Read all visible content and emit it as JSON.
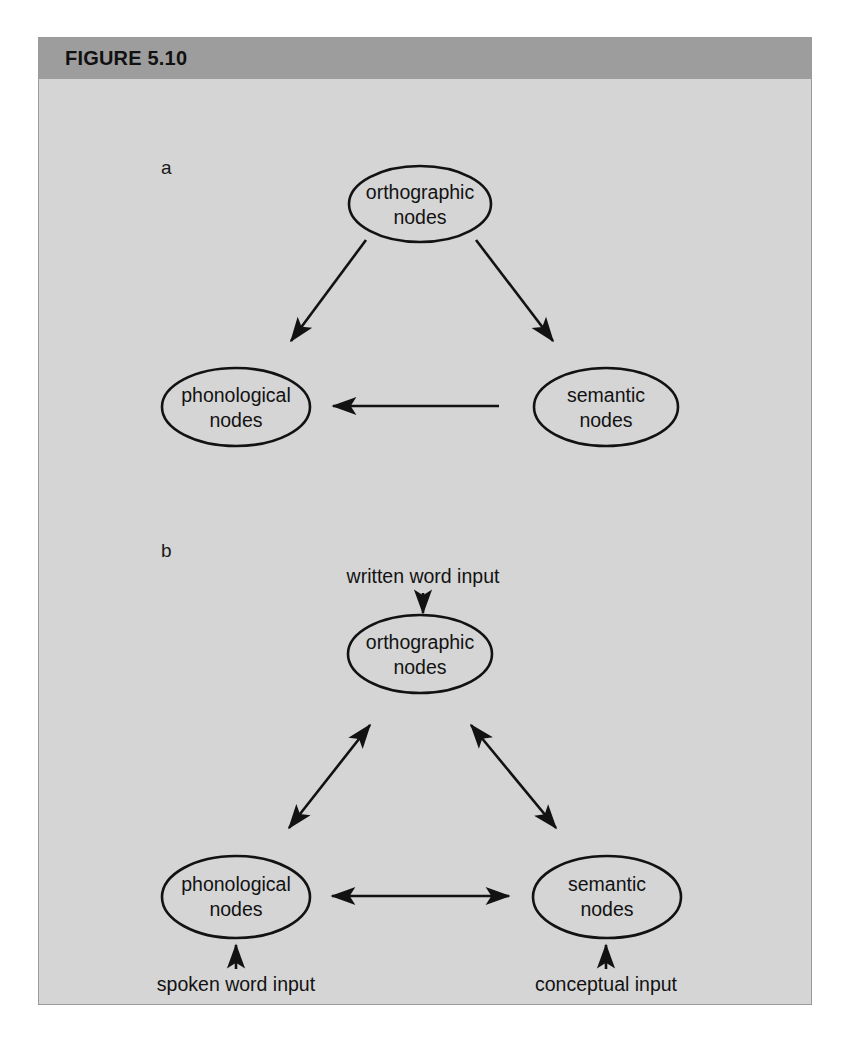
{
  "figure": {
    "header_label": "FIGURE 5.10",
    "background_color": "#d5d5d5",
    "header_color": "#9d9d9d",
    "border_color": "#9a9a9a",
    "ink_color": "#121212"
  },
  "panels": [
    {
      "letter": "a",
      "nodes": [
        {
          "id": "a-orthographic",
          "line1": "orthographic",
          "line2": "nodes"
        },
        {
          "id": "a-phonological",
          "line1": "phonological",
          "line2": "nodes"
        },
        {
          "id": "a-semantic",
          "line1": "semantic",
          "line2": "nodes"
        }
      ],
      "edges": [
        {
          "id": "a-ortho-to-phono",
          "from": "orthographic nodes",
          "to": "phonological nodes",
          "arrows": "single"
        },
        {
          "id": "a-ortho-to-sem",
          "from": "orthographic nodes",
          "to": "semantic nodes",
          "arrows": "single"
        },
        {
          "id": "a-sem-to-phono",
          "from": "semantic nodes",
          "to": "phonological nodes",
          "arrows": "single"
        }
      ]
    },
    {
      "letter": "b",
      "nodes": [
        {
          "id": "b-orthographic",
          "line1": "orthographic",
          "line2": "nodes"
        },
        {
          "id": "b-phonological",
          "line1": "phonological",
          "line2": "nodes"
        },
        {
          "id": "b-semantic",
          "line1": "semantic",
          "line2": "nodes"
        }
      ],
      "inputs": [
        {
          "id": "written-word-input",
          "label": "written word input",
          "target": "orthographic nodes",
          "direction": "down"
        },
        {
          "id": "spoken-word-input",
          "label": "spoken word input",
          "target": "phonological nodes",
          "direction": "up"
        },
        {
          "id": "conceptual-input",
          "label": "conceptual input",
          "target": "semantic nodes",
          "direction": "up"
        }
      ],
      "edges": [
        {
          "id": "b-ortho-phono",
          "from": "orthographic nodes",
          "to": "phonological nodes",
          "arrows": "double"
        },
        {
          "id": "b-ortho-sem",
          "from": "orthographic nodes",
          "to": "semantic nodes",
          "arrows": "double"
        },
        {
          "id": "b-phono-sem",
          "from": "phonological nodes",
          "to": "semantic nodes",
          "arrows": "double"
        }
      ]
    }
  ]
}
